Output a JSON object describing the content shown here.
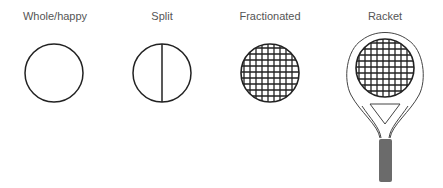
{
  "diagram": {
    "items": [
      {
        "label": "Whole/happy",
        "shape": "circle"
      },
      {
        "label": "Split",
        "shape": "circle-with-vertical-line"
      },
      {
        "label": "Fractionated",
        "shape": "gridded-circle"
      },
      {
        "label": "Racket",
        "shape": "tennis-racket"
      }
    ],
    "colors": {
      "stroke": "#222222",
      "handle": "#6b6b6b",
      "label": "#555555"
    }
  }
}
